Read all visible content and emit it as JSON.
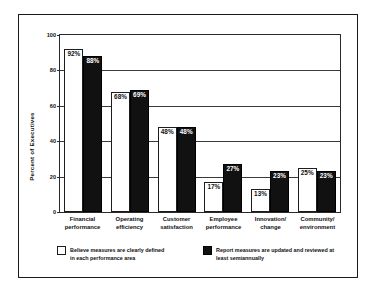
{
  "chart_data": {
    "type": "bar",
    "title": "",
    "xlabel": "",
    "ylabel": "Percent of Executives",
    "ylim": [
      0,
      100
    ],
    "yticks": [
      0,
      20,
      40,
      60,
      80,
      100
    ],
    "grid": true,
    "legend_position": "bottom",
    "categories": [
      "Financial\nperformance",
      "Operating\nefficiency",
      "Customer\nsatisfaction",
      "Employee\nperformance",
      "Innovation/\nchange",
      "Community/\nenvironment"
    ],
    "series": [
      {
        "name": "Believe measures are clearly defined in each performance area",
        "color": "#ffffff",
        "values": [
          92,
          68,
          48,
          17,
          13,
          25
        ],
        "labels": [
          "92%",
          "68%",
          "48%",
          "17%",
          "13%",
          "25%"
        ]
      },
      {
        "name": "Report measures are updated and reviewed at least semiannually",
        "color": "#111111",
        "values": [
          88,
          69,
          48,
          27,
          23,
          23
        ],
        "labels": [
          "88%",
          "69%",
          "48%",
          "27%",
          "23%",
          "23%"
        ]
      }
    ]
  },
  "axis": {
    "y_title": "Percent of Executives",
    "y_ticks": [
      "100",
      "80",
      "60",
      "40",
      "20",
      "0"
    ]
  },
  "x_categories": [
    {
      "line1": "Financial",
      "line2": "performance"
    },
    {
      "line1": "Operating",
      "line2": "efficiency"
    },
    {
      "line1": "Customer",
      "line2": "satisfaction"
    },
    {
      "line1": "Employee",
      "line2": "performance"
    },
    {
      "line1": "Innovation/",
      "line2": "change"
    },
    {
      "line1": "Community/",
      "line2": "environment"
    }
  ],
  "legend": {
    "items": [
      {
        "swatch": "light",
        "line1": "Believe measures are clearly defined",
        "line2": "in each performance area"
      },
      {
        "swatch": "dark",
        "line1": "Report measures are updated and reviewed at",
        "line2": "least semiannually"
      }
    ]
  },
  "colors": {
    "light_bar": "#ffffff",
    "dark_bar": "#111111",
    "axis": "#1a1a1a",
    "background": "#ffffff"
  }
}
